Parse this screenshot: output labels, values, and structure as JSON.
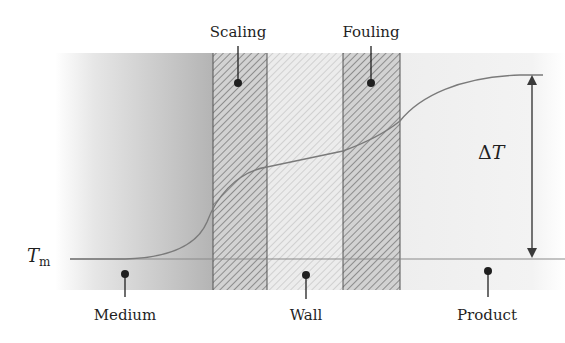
{
  "diagram": {
    "title": "",
    "layers": [
      {
        "id": "medium",
        "label": "Medium"
      },
      {
        "id": "scaling",
        "label": "Scaling"
      },
      {
        "id": "wall",
        "label": "Wall"
      },
      {
        "id": "fouling",
        "label": "Fouling"
      },
      {
        "id": "product",
        "label": "Product"
      }
    ],
    "baseline_label": "T",
    "baseline_subscript": "m",
    "delta_label_symbol": "Δ",
    "delta_label_var": "T",
    "colors": {
      "curve": "#7a7a7a",
      "baseline": "#8a8a8a",
      "band_border": "#555555",
      "arrow": "#3a3a3a",
      "text": "#1f1f1f",
      "medium_dark": "#a8a8a8",
      "product_light": "#f0f0f0"
    }
  }
}
